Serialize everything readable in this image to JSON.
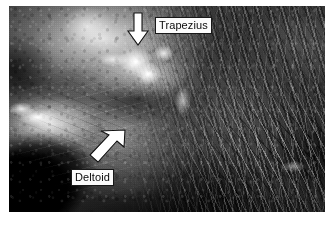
{
  "figure": {
    "kind": "grayscale-anatomical-photograph",
    "plate_background_color": "#ffffff",
    "tone": "grayscale"
  },
  "annotations": [
    {
      "id": "trapezius",
      "label": "Trapezius",
      "marker": "arrow",
      "arrow_direction": "down",
      "label_text_color": "#121212",
      "label_background_color": "#f2f2ee",
      "label_border_color": "#202020",
      "arrow_fill_color": "#ffffff",
      "arrow_outline_color": "#1a1a1a"
    },
    {
      "id": "deltoid",
      "label": "Deltoid",
      "marker": "arrow",
      "arrow_direction": "up-right",
      "label_text_color": "#121212",
      "label_background_color": "#f2f2ee",
      "label_border_color": "#202020",
      "arrow_fill_color": "#ffffff",
      "arrow_outline_color": "#1a1a1a"
    }
  ]
}
